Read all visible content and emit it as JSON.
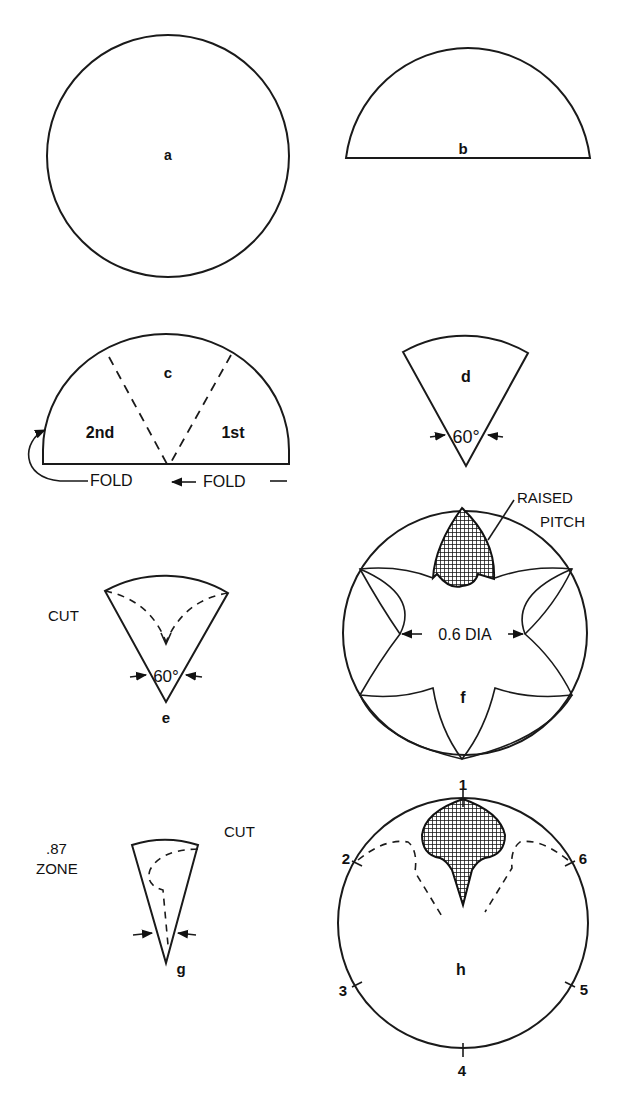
{
  "figures": {
    "a": {
      "label": "a",
      "shape": "full circle"
    },
    "b": {
      "label": "b",
      "shape": "semicircle"
    },
    "c": {
      "label": "c",
      "shape": "semicircle with two dashed fold lines",
      "left_section": "2nd",
      "right_section": "1st",
      "fold_left": "FOLD",
      "fold_right": "FOLD"
    },
    "d": {
      "label": "d",
      "shape": "60 degree sector",
      "angle": "60°"
    },
    "e": {
      "label": "e",
      "shape": "60 degree sector with dashed cut line",
      "angle": "60°",
      "cut": "CUT"
    },
    "f": {
      "label": "f",
      "shape": "circle with six-pointed star cut pattern",
      "dimension": "0.6 DIA",
      "callout_line1": "RAISED",
      "callout_line2": "PITCH"
    },
    "g": {
      "label": "g",
      "shape": "narrow sector with dashed cut",
      "zone_value": ".87",
      "zone_label": "ZONE",
      "cut": "CUT"
    },
    "h": {
      "label": "h",
      "shape": "circle with raised pitch and dashed outline",
      "marks": [
        "1",
        "2",
        "3",
        "4",
        "5",
        "6"
      ]
    }
  },
  "colors": {
    "ink": "#1a1a1a",
    "paper": "#ffffff"
  }
}
